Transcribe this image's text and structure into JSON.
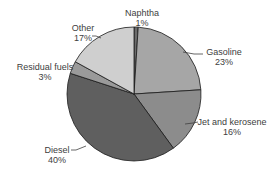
{
  "chart_data": {
    "type": "pie",
    "title": "",
    "categories": [
      "Naphtha",
      "Gasoline",
      "Jet and kerosene",
      "Diesel",
      "Residual fuels",
      "Other"
    ],
    "values": [
      1,
      23,
      16,
      40,
      3,
      17
    ],
    "labels": [
      "1%",
      "23%",
      "16%",
      "40%",
      "3%",
      "17%"
    ],
    "colors": [
      "#6b6b6b",
      "#a6a6a6",
      "#8c8c8c",
      "#5f5f5f",
      "#9a9a9a",
      "#cfcfcf"
    ],
    "start_angle_deg": 0,
    "direction": "clockwise",
    "legend": "none (data labels with leader lines)"
  },
  "labels": {
    "naphtha": {
      "name": "Naphtha",
      "pct": "1%"
    },
    "gasoline": {
      "name": "Gasoline",
      "pct": "23%"
    },
    "jet": {
      "name": "Jet and kerosene",
      "pct": "16%"
    },
    "diesel": {
      "name": "Diesel",
      "pct": "40%"
    },
    "residual": {
      "name": "Residual fuels",
      "pct": "3%"
    },
    "other": {
      "name": "Other",
      "pct": "17%"
    }
  }
}
